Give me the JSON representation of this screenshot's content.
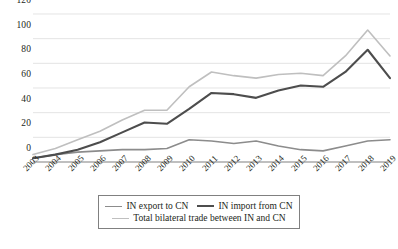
{
  "chart_data": {
    "type": "line",
    "title": "",
    "subtitle": "",
    "xlabel": "",
    "ylabel": "",
    "categories": [
      "2003",
      "2004",
      "2005",
      "2006",
      "2007",
      "2008",
      "2009",
      "2010",
      "2011",
      "2012",
      "2013",
      "2014",
      "2015",
      "2016",
      "2017",
      "2018",
      "2019"
    ],
    "x": [
      2003,
      2004,
      2005,
      2006,
      2007,
      2008,
      2009,
      2010,
      2011,
      2012,
      2013,
      2014,
      2015,
      2016,
      2017,
      2018,
      2019
    ],
    "ylim": [
      0,
      120
    ],
    "yticks": [
      0,
      20,
      40,
      60,
      80,
      100,
      120
    ],
    "ytick_labels": [
      "0",
      "20",
      "40",
      "60",
      "80",
      "100",
      "120"
    ],
    "grid": "horizontal",
    "legend_position": "bottom",
    "series": [
      {
        "name": "IN export  to CN",
        "color": "#8c8c8c",
        "values": [
          3,
          6,
          8,
          9,
          10,
          10,
          11,
          18,
          17,
          15,
          17,
          13,
          10,
          9,
          13,
          17,
          18
        ]
      },
      {
        "name": "IN import from CN",
        "color": "#4d4d4d",
        "values": [
          3,
          6,
          10,
          16,
          24,
          32,
          31,
          43,
          56,
          55,
          52,
          58,
          62,
          61,
          73,
          91,
          68
        ]
      },
      {
        "name": "Total bilateral trade between IN and CN",
        "color": "#bfbfbf",
        "values": [
          6,
          11,
          18,
          25,
          34,
          42,
          42,
          61,
          73,
          70,
          68,
          71,
          72,
          70,
          86,
          107,
          86
        ]
      }
    ]
  },
  "legend": {
    "items": [
      {
        "label": "IN export  to CN"
      },
      {
        "label": "IN import from CN"
      },
      {
        "label": "Total bilateral trade between IN and CN"
      }
    ]
  },
  "colors": {
    "export_line": "#8c8c8c",
    "import_line": "#4d4d4d",
    "total_line": "#bfbfbf",
    "gridline": "#d9d9d9",
    "axis": "#808080",
    "text": "#231f20",
    "background": "#ffffff"
  }
}
